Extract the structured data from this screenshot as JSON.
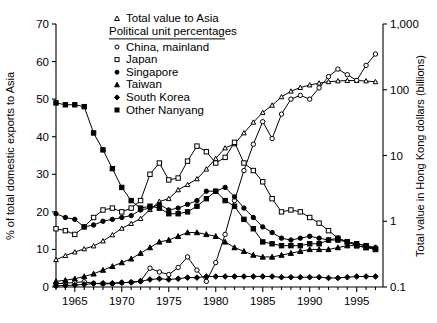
{
  "chart_data": {
    "type": "line",
    "title": "",
    "xlabel": "",
    "ylabel": "% of total domestic exports to Asia",
    "ylabel_right": "Total value in Hong Kong dollars (billions)",
    "xlim": [
      1963,
      1997.8
    ],
    "ylim": [
      0,
      70
    ],
    "ylim_right": [
      0.1,
      1000
    ],
    "right_axis_scale": "log",
    "grid": false,
    "legend_position": "top-center",
    "xticks": [
      1965,
      1970,
      1975,
      1980,
      1985,
      1990,
      1995
    ],
    "xtick_labels": [
      "1965",
      "1970",
      "1975",
      "1980",
      "1985",
      "1990",
      "1995"
    ],
    "xminor_step": 1,
    "yticks": [
      0,
      10,
      20,
      30,
      40,
      50,
      60,
      70
    ],
    "ytick_labels": [
      "0",
      "10",
      "20",
      "30",
      "40",
      "50",
      "60",
      "70"
    ],
    "yticks_right": [
      0.1,
      1,
      10,
      100,
      1000
    ],
    "ytick_labels_right": [
      "0.1",
      "1",
      "10",
      "100",
      "1,000"
    ],
    "legend_title": "Political unit percentages",
    "legend_first_entry": "Total value to Asia",
    "x": [
      1963,
      1964,
      1965,
      1966,
      1967,
      1968,
      1969,
      1970,
      1971,
      1972,
      1973,
      1974,
      1975,
      1976,
      1977,
      1978,
      1979,
      1980,
      1981,
      1982,
      1983,
      1984,
      1985,
      1986,
      1987,
      1988,
      1989,
      1990,
      1991,
      1992,
      1993,
      1994,
      1995,
      1996,
      1997
    ],
    "series": [
      {
        "name": "Total value to Asia",
        "marker": "triangle-open",
        "axis": "right",
        "unit": "billions HK$",
        "values": [
          0.26,
          0.3,
          0.34,
          0.38,
          0.42,
          0.5,
          0.62,
          0.78,
          0.92,
          1.1,
          1.5,
          2.0,
          2.2,
          3.0,
          3.6,
          4.4,
          6.2,
          9.0,
          13.0,
          15.0,
          22.0,
          32.0,
          45.0,
          58.0,
          78.0,
          95.0,
          108.0,
          118.0,
          126.0,
          132.0,
          136.0,
          138.0,
          138.0,
          136.0,
          132.0
        ]
      },
      {
        "name": "China, mainland",
        "marker": "circle-open",
        "axis": "left",
        "values": [
          0.9,
          1.0,
          1.2,
          1.4,
          1.0,
          0.8,
          0.9,
          1.1,
          1.3,
          1.6,
          5.0,
          4.0,
          3.3,
          5.2,
          8.0,
          4.5,
          1.5,
          6.5,
          14.0,
          23.0,
          31.0,
          38.0,
          44.0,
          39.5,
          46.0,
          50.0,
          51.0,
          50.0,
          53.0,
          56.0,
          58.0,
          56.5,
          55.0,
          59.0,
          62.0
        ]
      },
      {
        "name": "Japan",
        "marker": "square-open",
        "axis": "left",
        "values": [
          15.5,
          15.0,
          14.0,
          16.0,
          18.5,
          20.5,
          21.0,
          20.0,
          21.0,
          23.0,
          30.0,
          33.0,
          28.5,
          29.0,
          33.5,
          37.5,
          36.0,
          33.0,
          34.5,
          38.5,
          33.0,
          31.0,
          28.0,
          23.5,
          20.0,
          20.5,
          20.0,
          18.5,
          17.0,
          15.0,
          13.0,
          12.0,
          11.0,
          10.5,
          10.0
        ]
      },
      {
        "name": "Singapore",
        "marker": "circle-filled",
        "axis": "left",
        "values": [
          19.5,
          18.5,
          18.0,
          16.0,
          16.5,
          17.5,
          18.0,
          18.5,
          19.0,
          20.5,
          21.0,
          22.0,
          20.5,
          21.0,
          22.0,
          23.0,
          25.5,
          25.5,
          26.5,
          24.0,
          21.0,
          18.5,
          16.0,
          14.5,
          13.0,
          12.5,
          13.0,
          13.5,
          13.0,
          12.5,
          13.0,
          12.0,
          11.5,
          11.0,
          10.5
        ]
      },
      {
        "name": "Taiwan",
        "marker": "triangle-filled",
        "axis": "left",
        "values": [
          1.5,
          1.8,
          2.2,
          2.8,
          3.5,
          4.5,
          5.5,
          6.5,
          7.5,
          9.0,
          10.5,
          12.0,
          12.5,
          13.5,
          14.5,
          14.5,
          14.0,
          13.5,
          12.0,
          10.5,
          9.5,
          8.5,
          8.0,
          8.0,
          8.5,
          9.0,
          9.5,
          10.0,
          10.0,
          10.0,
          10.5,
          11.0,
          11.0,
          10.5,
          10.5
        ]
      },
      {
        "name": "South Korea",
        "marker": "diamond-filled",
        "axis": "left",
        "values": [
          0.3,
          0.4,
          0.5,
          0.7,
          0.9,
          1.0,
          1.0,
          1.2,
          1.2,
          1.5,
          2.0,
          2.2,
          2.0,
          2.2,
          2.5,
          2.5,
          2.8,
          2.8,
          2.8,
          2.8,
          2.8,
          2.8,
          2.8,
          2.8,
          2.6,
          2.6,
          2.6,
          2.6,
          2.6,
          2.4,
          2.4,
          2.6,
          2.8,
          2.8,
          2.8
        ]
      },
      {
        "name": "Other Nanyang",
        "marker": "square-filled",
        "axis": "left",
        "values": [
          49.0,
          48.5,
          48.5,
          48.0,
          41.0,
          36.5,
          31.5,
          26.5,
          23.0,
          21.0,
          21.5,
          21.0,
          19.5,
          19.5,
          20.0,
          21.5,
          23.5,
          25.5,
          23.0,
          21.5,
          18.0,
          15.5,
          12.0,
          11.5,
          11.0,
          11.0,
          11.0,
          11.5,
          11.5,
          12.5,
          12.5,
          12.0,
          11.5,
          11.0,
          10.0
        ]
      }
    ],
    "legend_entries": [
      {
        "label": "Total value to Asia",
        "marker": "triangle-open"
      },
      {
        "label": "China, mainland",
        "marker": "circle-open"
      },
      {
        "label": "Japan",
        "marker": "square-open"
      },
      {
        "label": "Singapore",
        "marker": "circle-filled"
      },
      {
        "label": "Taiwan",
        "marker": "triangle-filled"
      },
      {
        "label": "South Korea",
        "marker": "diamond-filled"
      },
      {
        "label": "Other Nanyang",
        "marker": "square-filled"
      }
    ]
  }
}
